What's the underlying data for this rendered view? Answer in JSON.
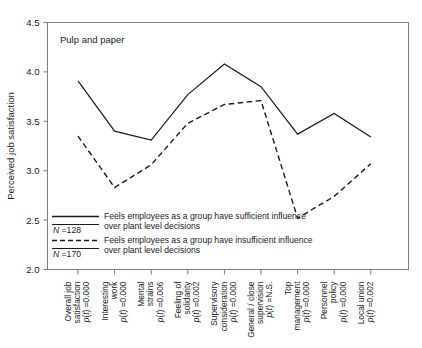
{
  "chart_data": {
    "type": "line",
    "title": "Pulp and paper",
    "xlabel": "",
    "ylabel": "Perceived job satisfaction",
    "ylim": [
      2.0,
      4.5
    ],
    "yticks": [
      "2.0",
      "2.5",
      "3.0",
      "3.5",
      "4.0",
      "4.5"
    ],
    "grid": false,
    "legend_position": "inside-lower-left",
    "categories": [
      "Overall job satisfaction",
      "Interesting work",
      "Mental strains",
      "Feeling of solidarity",
      "Supervisory consideration",
      "General / close supervision",
      "Top management",
      "Personnel policy",
      "Local union"
    ],
    "category_lines": [
      [
        "Overall job",
        "satisfaction"
      ],
      [
        "Interesting",
        "work"
      ],
      [
        "Mental",
        "strains"
      ],
      [
        "Feeling of",
        "solidarity"
      ],
      [
        "Supervisory",
        "consideration"
      ],
      [
        "General / close",
        "supervision"
      ],
      [
        "Top",
        "management"
      ],
      [
        "Personnel",
        "policy"
      ],
      [
        "Local union"
      ]
    ],
    "category_pvalues": [
      "p(t) =0.000",
      "p(t) =0.000",
      "p(t) =0.006",
      "p(t) =0.002",
      "p(t) =0.000",
      "p(t) =N.S.",
      "p(t) =0.000",
      "p(t) =0.000",
      "p(t) =0.002"
    ],
    "series": [
      {
        "name": "Feels employees as a group have sufficient influence over plant level decisions",
        "style": "solid",
        "n_label": "N =128",
        "values": [
          3.91,
          3.4,
          3.31,
          3.77,
          4.08,
          3.85,
          3.37,
          3.58,
          3.34
        ]
      },
      {
        "name": "Feels employees as a group have insufficient influence over plant level decisions",
        "style": "dashed",
        "n_label": "N =170",
        "values": [
          3.35,
          2.83,
          3.06,
          3.48,
          3.67,
          3.71,
          2.52,
          2.74,
          3.07
        ]
      }
    ]
  },
  "legend": {
    "entries": [
      {
        "n_label_prefix": "N",
        "n_label_value": " =128",
        "line1": "Feels employees as a group have sufficient influence",
        "line2": "over plant level decisions"
      },
      {
        "n_label_prefix": "N",
        "n_label_value": " =170",
        "line1": "Feels employees as a group have  insufficient  influence",
        "line2": "over plant level decisions"
      }
    ]
  },
  "colors": {
    "ink": "#1a1a1a",
    "axis": "#808080",
    "background": "#ffffff"
  }
}
